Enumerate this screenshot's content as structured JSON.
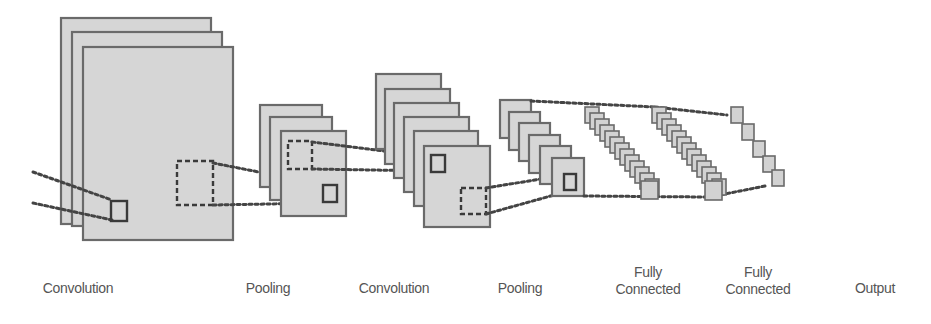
{
  "diagram": {
    "colors": {
      "fill": "#d6d6d6",
      "stroke": "#6a6a6a",
      "dots": "#444444",
      "label": "#555555",
      "background": "#ffffff"
    },
    "stages": [
      {
        "id": "conv1",
        "type": "feature-maps",
        "label_lines": [
          "Convolution"
        ],
        "map_count": 3
      },
      {
        "id": "pool1",
        "type": "feature-maps",
        "label_lines": [
          "Pooling"
        ],
        "map_count": 3
      },
      {
        "id": "conv2",
        "type": "feature-maps",
        "label_lines": [
          "Convolution"
        ],
        "map_count": 6
      },
      {
        "id": "pool2",
        "type": "feature-maps",
        "label_lines": [
          "Pooling"
        ],
        "map_count": 6
      },
      {
        "id": "fc1",
        "type": "vector",
        "label_lines": [
          "Fully",
          "Connected"
        ],
        "node_count": 14
      },
      {
        "id": "fc2",
        "type": "vector",
        "label_lines": [
          "Fully",
          "Connected"
        ],
        "node_count": 14
      },
      {
        "id": "output",
        "type": "vector",
        "label_lines": [
          "Output"
        ],
        "node_count": 5
      }
    ]
  },
  "labels": {
    "conv1": {
      "line1": "Convolution"
    },
    "pool1": {
      "line1": "Pooling"
    },
    "conv2": {
      "line1": "Convolution"
    },
    "pool2": {
      "line1": "Pooling"
    },
    "fc1": {
      "line1": "Fully",
      "line2": "Connected"
    },
    "fc2": {
      "line1": "Fully",
      "line2": "Connected"
    },
    "output": {
      "line1": "Output"
    }
  }
}
